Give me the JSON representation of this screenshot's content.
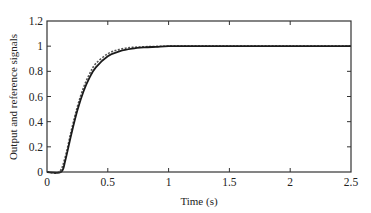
{
  "chart_data": {
    "type": "line",
    "title": "",
    "xlabel": "Time (s)",
    "ylabel": "Output and reference signals",
    "xlim": [
      0,
      2.5
    ],
    "ylim": [
      0,
      1.2
    ],
    "xticks": [
      0,
      0.5,
      1,
      1.5,
      2,
      2.5
    ],
    "xtick_labels": [
      "0",
      "0.5",
      "1",
      "1.5",
      "2",
      "2.5"
    ],
    "yticks": [
      0,
      0.2,
      0.4,
      0.6,
      0.8,
      1,
      1.2
    ],
    "ytick_labels": [
      "0",
      "0.2",
      "0.4",
      "0.6",
      "0.8",
      "1",
      "1.2"
    ],
    "grid": false,
    "legend": null,
    "series": [
      {
        "name": "Reference signal",
        "style": "dashed",
        "x": [
          0,
          0.1,
          0.15,
          0.2,
          0.25,
          0.3,
          0.35,
          0.4,
          0.5,
          0.6,
          0.7,
          0.8,
          0.9,
          1.0,
          1.2,
          1.5,
          2.0,
          2.5
        ],
        "y": [
          0,
          0,
          0.12,
          0.33,
          0.52,
          0.67,
          0.78,
          0.86,
          0.94,
          0.975,
          0.99,
          0.995,
          0.998,
          1.0,
          1.0,
          1.0,
          1.0,
          1.0
        ]
      },
      {
        "name": "Output signal",
        "style": "solid",
        "x": [
          0,
          0.115,
          0.15,
          0.2,
          0.25,
          0.3,
          0.35,
          0.4,
          0.5,
          0.6,
          0.7,
          0.8,
          0.9,
          1.0,
          1.2,
          1.5,
          2.0,
          2.5
        ],
        "y": [
          0,
          0,
          0.09,
          0.3,
          0.49,
          0.64,
          0.75,
          0.83,
          0.92,
          0.96,
          0.98,
          0.99,
          0.995,
          1.0,
          1.0,
          1.0,
          1.0,
          1.0
        ]
      }
    ]
  }
}
